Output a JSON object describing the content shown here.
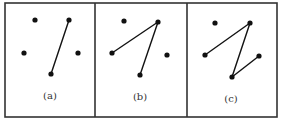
{
  "figure": {
    "panels": [
      {
        "label": "(a)",
        "points": [
          [
            35,
            20
          ],
          [
            69,
            20
          ],
          [
            24,
            53
          ],
          [
            78,
            53
          ],
          [
            51,
            74
          ]
        ],
        "edges": [
          [
            [
              69,
              20
            ],
            [
              51,
              74
            ]
          ]
        ]
      },
      {
        "label": "(b)",
        "points": [
          [
            124,
            21
          ],
          [
            158,
            22
          ],
          [
            112,
            53
          ],
          [
            167,
            55
          ],
          [
            140,
            75
          ]
        ],
        "edges": [
          [
            [
              158,
              22
            ],
            [
              112,
              53
            ]
          ],
          [
            [
              158,
              22
            ],
            [
              140,
              75
            ]
          ]
        ]
      },
      {
        "label": "(c)",
        "points": [
          [
            215,
            23
          ],
          [
            250,
            23
          ],
          [
            205,
            55
          ],
          [
            259,
            56
          ],
          [
            232,
            77
          ]
        ],
        "edges": [
          [
            [
              250,
              23
            ],
            [
              205,
              55
            ]
          ],
          [
            [
              250,
              23
            ],
            [
              232,
              77
            ]
          ],
          [
            [
              232,
              77
            ],
            [
              259,
              56
            ]
          ]
        ]
      }
    ]
  }
}
